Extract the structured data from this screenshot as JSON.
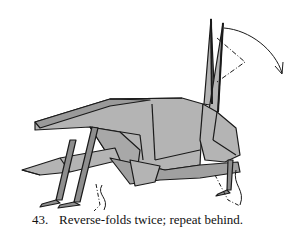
{
  "diagram": {
    "step_number": "43.",
    "caption": "Reverse-folds twice; repeat behind.",
    "colors": {
      "paper": "#b4b4b4",
      "paper_dark": "#8e8e8e",
      "line": "#1a1a1a",
      "background": "#ffffff"
    },
    "annotations": [
      {
        "type": "curved-arrow",
        "label": "fold-direction-arrow"
      },
      {
        "type": "dash-dot-line",
        "label": "reverse-fold-line-antenna"
      },
      {
        "type": "dash-dot-line",
        "label": "reverse-fold-line-front-leg"
      },
      {
        "type": "dash-dot-line",
        "label": "reverse-fold-line-hind-leg"
      }
    ]
  }
}
